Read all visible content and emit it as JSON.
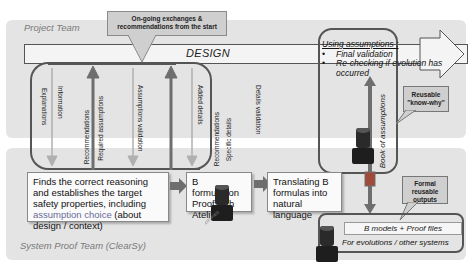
{
  "teams": {
    "project": "Project Team",
    "proof": "System Proof Team (ClearSy)"
  },
  "callout_top": "On-going exchanges & recommendations from the start",
  "design_label": "DESIGN",
  "loop_labels": {
    "explanations": "Explanations",
    "information": "Information",
    "recommendations_1": "Recommendations",
    "required_assumptions": "Required assumptions",
    "assumptions_validation": "Assumptions validation",
    "added_details": "Added details",
    "recommendations_2": "Recommendations",
    "specific_details": "Specific details",
    "details_validation": "Details validation"
  },
  "using_assumptions": {
    "title": "Using assumptions :",
    "items": [
      "Final validation",
      "Re-checking if evolution has occurred"
    ]
  },
  "book_label": "Book of assumptions",
  "reusable_knowwhy": "Reusable \"know-why\"",
  "formal_outputs": "Formal reusable outputs",
  "step_boxes": {
    "reasoning_pre": "Finds the correct reasoning and establishes the target safety properties, including ",
    "reasoning_hl": "assumption choice",
    "reasoning_post": " (about design / context)",
    "b_formulation": "B formulation Proof with Atelier B",
    "translating": "Translating B formulas into natural language"
  },
  "outputs": {
    "models": "B models + Proof files",
    "evolutions": "For evolutions / other systems"
  },
  "stamp_text": "CERTIFIED",
  "colors": {
    "band": "#e4e4e4",
    "border": "#555555",
    "arrow_dark": "#6e6e6e",
    "arrow_light": "#b0b0b0",
    "stamp": "#2a2a2a"
  }
}
